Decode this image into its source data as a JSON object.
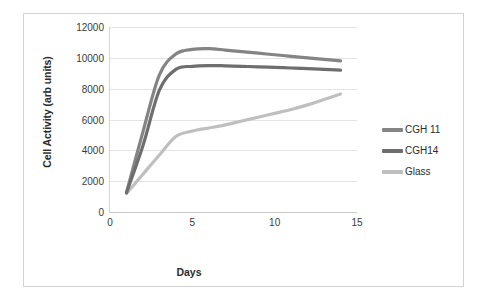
{
  "chart_data": {
    "type": "line",
    "title": "",
    "xlabel": "Days",
    "ylabel": "Cell Activity (arb units)",
    "xlim": [
      0,
      15
    ],
    "ylim": [
      0,
      12000
    ],
    "xticks": [
      0,
      5,
      10,
      15
    ],
    "yticks": [
      0,
      2000,
      4000,
      6000,
      8000,
      10000,
      12000
    ],
    "grid": "horizontal",
    "legend_position": "right",
    "x": [
      1,
      2,
      3,
      4,
      5,
      6,
      7,
      8,
      9,
      10,
      11,
      12,
      13,
      14
    ],
    "series": [
      {
        "name": "CGH 11",
        "color": "#848484",
        "values": [
          1250,
          5200,
          8900,
          10250,
          10550,
          10600,
          10500,
          10400,
          10300,
          10200,
          10100,
          10000,
          9900,
          9800
        ]
      },
      {
        "name": "CGH14",
        "color": "#6e6e6e",
        "values": [
          1250,
          4300,
          7900,
          9250,
          9450,
          9500,
          9480,
          9450,
          9420,
          9380,
          9340,
          9300,
          9250,
          9200
        ]
      },
      {
        "name": "Glass",
        "color": "#bfbfbf",
        "values": [
          1200,
          2450,
          3700,
          4900,
          5250,
          5450,
          5650,
          5900,
          6150,
          6400,
          6650,
          6950,
          7300,
          7650
        ]
      }
    ]
  },
  "legend": {
    "entries": [
      {
        "label": "CGH 11",
        "color": "#848484"
      },
      {
        "label": "CGH14",
        "color": "#6e6e6e"
      },
      {
        "label": "Glass",
        "color": "#bfbfbf"
      }
    ]
  },
  "axes": {
    "y_title": "Cell Activity (arb units)",
    "x_title": "Days",
    "y_tick_labels": [
      "0",
      "2000",
      "4000",
      "6000",
      "8000",
      "10000",
      "12000"
    ],
    "x_tick_labels": [
      "0",
      "5",
      "10",
      "15"
    ]
  }
}
